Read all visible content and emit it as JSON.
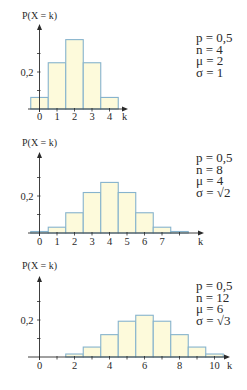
{
  "colors": {
    "bar_fill": "#fdfadb",
    "bar_stroke": "#86b3cd",
    "axis": "#2a2a2a",
    "text": "#2a2a2a"
  },
  "chart_data": [
    {
      "type": "bar",
      "title": "",
      "ylabel": "P(X = k)",
      "xlabel": "k",
      "ytick_labels": [
        "0,2"
      ],
      "xtick_labels": [
        "0",
        "1",
        "2",
        "3",
        "4"
      ],
      "categories": [
        0,
        1,
        2,
        3,
        4
      ],
      "values": [
        0.0625,
        0.25,
        0.375,
        0.25,
        0.0625
      ],
      "params": [
        "p = 0,5",
        "n = 4",
        "μ = 2",
        "σ = 1"
      ],
      "ylim": [
        0,
        0.45
      ],
      "grid": false,
      "legend": "none"
    },
    {
      "type": "bar",
      "title": "",
      "ylabel": "P(X = k)",
      "xlabel": "k",
      "ytick_labels": [
        "0,2"
      ],
      "xtick_labels": [
        "0",
        "1",
        "2",
        "3",
        "4",
        "5",
        "6",
        "7"
      ],
      "categories": [
        0,
        1,
        2,
        3,
        4,
        5,
        6,
        7,
        8
      ],
      "values": [
        0.0039,
        0.0313,
        0.1094,
        0.2188,
        0.2734,
        0.2188,
        0.1094,
        0.0313,
        0.0039
      ],
      "params": [
        "p = 0,5",
        "n = 8",
        "μ = 4",
        "σ = √2"
      ],
      "ylim": [
        0,
        0.45
      ],
      "grid": false,
      "legend": "none"
    },
    {
      "type": "bar",
      "title": "",
      "ylabel": "P(X = k)",
      "xlabel": "k",
      "ytick_labels": [
        "0,2"
      ],
      "xtick_labels": [
        "0",
        "2",
        "4",
        "6",
        "8",
        "10"
      ],
      "categories": [
        0,
        1,
        2,
        3,
        4,
        5,
        6,
        7,
        8,
        9,
        10,
        11,
        12
      ],
      "values": [
        0.0002,
        0.0029,
        0.0161,
        0.0537,
        0.1208,
        0.1934,
        0.2256,
        0.1934,
        0.1208,
        0.0537,
        0.0161,
        0.0029,
        0.0002
      ],
      "params": [
        "p = 0,5",
        "n = 12",
        "μ = 6",
        "σ = √3"
      ],
      "ylim": [
        0,
        0.45
      ],
      "grid": false,
      "legend": "none"
    }
  ],
  "layout": [
    {
      "x0": 39.5,
      "base": 109,
      "top": 24,
      "xmax": 10,
      "label_y": 19,
      "tick_label_y": 120,
      "params_top": 32,
      "kmax_axis": 128,
      "k_label_x": 122,
      "unit": 17.5,
      "scale": 185,
      "show_from": 0,
      "show_to": 4,
      "xticks": [
        0,
        1,
        2,
        3,
        4
      ]
    },
    {
      "x0": 39.5,
      "base": 233,
      "top": 152,
      "label_y": 146,
      "tick_label_y": 245,
      "params_top": 153,
      "kmax_axis": 204,
      "k_label_x": 198,
      "unit": 17.5,
      "scale": 185,
      "show_from": 0,
      "show_to": 8,
      "xticks": [
        0,
        1,
        2,
        3,
        4,
        5,
        6,
        7
      ]
    },
    {
      "x0": 39.5,
      "base": 357,
      "top": 276,
      "label_y": 269,
      "tick_label_y": 369,
      "params_top": 281,
      "kmax_axis": 230,
      "k_label_x": 227,
      "unit": 17.5,
      "scale": 185,
      "show_from": 2,
      "show_to": 10,
      "xticks": [
        0,
        2,
        4,
        6,
        8,
        10
      ]
    }
  ]
}
